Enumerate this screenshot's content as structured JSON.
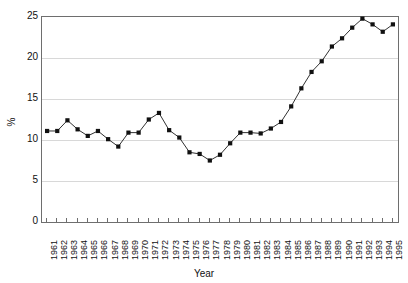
{
  "chart_data": {
    "type": "line",
    "title": "",
    "xlabel": "Year",
    "ylabel": "%",
    "ylim": [
      0,
      25
    ],
    "yticks": [
      0,
      5,
      10,
      15,
      20,
      25
    ],
    "grid": true,
    "legend": false,
    "marker": "square",
    "line_color": "#1a1a1a",
    "marker_color": "#111111",
    "grid_color": "#d8d8d8",
    "axis_color": "#6e6e6e",
    "categories": [
      "1961",
      "1962",
      "1963",
      "1964",
      "1965",
      "1966",
      "1967",
      "1968",
      "1969",
      "1970",
      "1971",
      "1972",
      "1973",
      "1974",
      "1975",
      "1976",
      "1977",
      "1978",
      "1979",
      "1980",
      "1981",
      "1982",
      "1983",
      "1984",
      "1985",
      "1986",
      "1987",
      "1988",
      "1989",
      "1990",
      "1991",
      "1992",
      "1993",
      "1994",
      "1995"
    ],
    "values": [
      11.1,
      11.1,
      12.4,
      11.3,
      10.5,
      11.1,
      10.1,
      9.2,
      10.9,
      10.9,
      12.5,
      13.3,
      11.2,
      10.3,
      8.5,
      8.3,
      7.5,
      8.2,
      9.6,
      10.9,
      10.9,
      10.8,
      11.4,
      12.2,
      14.1,
      16.3,
      18.3,
      19.6,
      21.4,
      22.4,
      23.7,
      24.8,
      24.1,
      23.2,
      24.1
    ]
  }
}
